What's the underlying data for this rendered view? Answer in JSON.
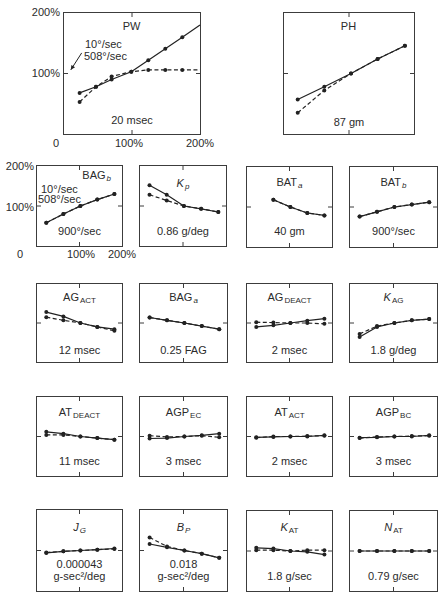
{
  "axes": {
    "top_row": {
      "y_ticks": [
        "200%",
        "100%"
      ],
      "x_ticks": [
        "0",
        "100%",
        "200%"
      ]
    },
    "second_row": {
      "y_ticks": [
        "200%",
        "100%"
      ],
      "x_ticks": [
        "0",
        "100%",
        "200%"
      ]
    }
  },
  "style": {
    "line_color": "#222222",
    "text_color": "#2b2b2b",
    "border_color": "#3c3c3c"
  },
  "chart_data": [
    {
      "id": "PW",
      "type": "line",
      "title": {
        "main": "PW",
        "sub": ""
      },
      "value_label": [
        "20 msec"
      ],
      "xlim": [
        0,
        200
      ],
      "ylim": [
        0,
        200
      ],
      "xlabel": "",
      "ylabel": "",
      "x_tick_labels": [
        "0",
        "100%",
        "200%"
      ],
      "y_tick_labels": [
        "100%",
        "200%"
      ],
      "x": [
        23,
        47,
        70,
        99,
        124,
        149,
        174
      ],
      "series": [
        {
          "name": "10°/sec",
          "style": "solid",
          "values": [
            68,
            78,
            90,
            103,
            122,
            141,
            160
          ],
          "end": [
            200,
            180
          ]
        },
        {
          "name": "508°/sec",
          "style": "dashed",
          "values": [
            53,
            78,
            95,
            103,
            106,
            106,
            106
          ],
          "end": [
            200,
            106
          ]
        }
      ],
      "annotations": [
        {
          "text": "10°/sec"
        },
        {
          "text": "508°/sec"
        },
        {
          "type": "arrow",
          "from": [
            26,
            134
          ],
          "to": [
            10,
            106
          ]
        }
      ]
    },
    {
      "id": "PH",
      "type": "line",
      "title": {
        "main": "PH",
        "sub": ""
      },
      "value_label": [
        "87 gm"
      ],
      "xlim": [
        0,
        200
      ],
      "ylim": [
        0,
        200
      ],
      "x": [
        21,
        62,
        103,
        144,
        186
      ],
      "series": [
        {
          "name": "10°/sec",
          "style": "solid",
          "values": [
            57,
            78,
            100,
            124,
            146
          ]
        },
        {
          "name": "508°/sec",
          "style": "dashed",
          "values": [
            35,
            72,
            100,
            124,
            146
          ]
        }
      ]
    },
    {
      "id": "BAGb",
      "type": "line",
      "title": {
        "main": "BAG",
        "sub": "b"
      },
      "value_label": [
        "900°/sec"
      ],
      "xlim": [
        0,
        200
      ],
      "ylim": [
        0,
        200
      ],
      "x_tick_labels": [
        "0",
        "100%",
        "200%"
      ],
      "y_tick_labels": [
        "100%",
        "200%"
      ],
      "x": [
        22,
        62,
        102,
        142,
        182
      ],
      "series": [
        {
          "name": "10°/sec",
          "style": "solid",
          "values": [
            58,
            80,
            100,
            116,
            130
          ]
        },
        {
          "name": "508°/sec",
          "style": "dashed",
          "values": [
            58,
            80,
            100,
            116,
            130
          ]
        }
      ],
      "annotations": [
        {
          "text": "10°/sec"
        },
        {
          "text": "508°/sec"
        }
      ]
    },
    {
      "id": "Kp",
      "type": "line",
      "title": {
        "main": "K",
        "sub": "p"
      },
      "value_label": [
        "0.86 g/deg"
      ],
      "xlim": [
        0,
        200
      ],
      "ylim": [
        0,
        200
      ],
      "x": [
        22,
        62,
        102,
        142,
        182
      ],
      "series": [
        {
          "name": "10°/sec",
          "style": "solid",
          "values": [
            152,
            128,
            100,
            93,
            85
          ]
        },
        {
          "name": "508°/sec",
          "style": "dashed",
          "values": [
            128,
            114,
            100,
            93,
            85
          ]
        }
      ]
    },
    {
      "id": "BATa",
      "type": "line",
      "title": {
        "main": "BAT",
        "sub": "a"
      },
      "value_label": [
        "40 gm"
      ],
      "xlim": [
        0,
        200
      ],
      "ylim": [
        0,
        200
      ],
      "x": [
        22,
        62,
        102,
        142,
        182
      ],
      "series": [
        {
          "name": "10°/sec",
          "style": "solid",
          "values": [
            null,
            118,
            100,
            85,
            79
          ]
        },
        {
          "name": "508°/sec",
          "style": "dashed",
          "values": [
            null,
            118,
            100,
            85,
            79
          ]
        }
      ]
    },
    {
      "id": "BATb",
      "type": "line",
      "title": {
        "main": "BAT",
        "sub": "b"
      },
      "value_label": [
        "900°/sec"
      ],
      "xlim": [
        0,
        200
      ],
      "ylim": [
        0,
        200
      ],
      "x": [
        22,
        62,
        102,
        142,
        182
      ],
      "series": [
        {
          "name": "10°/sec",
          "style": "solid",
          "values": [
            76,
            88,
            100,
            106,
            112
          ]
        },
        {
          "name": "508°/sec",
          "style": "dashed",
          "values": [
            76,
            88,
            100,
            106,
            112
          ]
        }
      ]
    },
    {
      "id": "AG_ACT",
      "type": "line",
      "title": {
        "main": "AG",
        "sub": "ACT"
      },
      "value_label": [
        "12 msec"
      ],
      "xlim": [
        0,
        200
      ],
      "ylim": [
        0,
        200
      ],
      "x": [
        22,
        62,
        102,
        142,
        182
      ],
      "series": [
        {
          "name": "10°/sec",
          "style": "solid",
          "values": [
            128,
            117,
            100,
            90,
            84
          ]
        },
        {
          "name": "508°/sec",
          "style": "dashed",
          "values": [
            115,
            107,
            100,
            90,
            80
          ]
        }
      ]
    },
    {
      "id": "BAGa",
      "type": "line",
      "title": {
        "main": "BAG",
        "sub": "a"
      },
      "value_label": [
        "0.25 FAG"
      ],
      "xlim": [
        0,
        200
      ],
      "ylim": [
        0,
        200
      ],
      "x": [
        22,
        62,
        102,
        142,
        182
      ],
      "series": [
        {
          "name": "10°/sec",
          "style": "solid",
          "values": [
            114,
            107,
            100,
            92,
            84
          ]
        },
        {
          "name": "508°/sec",
          "style": "dashed",
          "values": [
            114,
            107,
            100,
            92,
            84
          ]
        }
      ]
    },
    {
      "id": "AG_DEACT",
      "type": "line",
      "title": {
        "main": "AG",
        "sub": "DEACT"
      },
      "value_label": [
        "2 msec"
      ],
      "xlim": [
        0,
        200
      ],
      "ylim": [
        0,
        200
      ],
      "x": [
        22,
        62,
        102,
        142,
        182
      ],
      "series": [
        {
          "name": "10°/sec",
          "style": "solid",
          "values": [
            90,
            94,
            100,
            106,
            111
          ]
        },
        {
          "name": "508°/sec",
          "style": "dashed",
          "values": [
            102,
            101,
            100,
            100,
            98
          ]
        }
      ]
    },
    {
      "id": "K_AG",
      "type": "line",
      "title": {
        "main": "K",
        "sub": "AG"
      },
      "value_label": [
        "1.8 g/deg"
      ],
      "xlim": [
        0,
        200
      ],
      "ylim": [
        0,
        200
      ],
      "x": [
        22,
        62,
        102,
        142,
        182
      ],
      "series": [
        {
          "name": "10°/sec",
          "style": "solid",
          "values": [
            64,
            90,
            100,
            107,
            110
          ]
        },
        {
          "name": "508°/sec",
          "style": "dashed",
          "values": [
            72,
            92,
            100,
            107,
            110
          ]
        }
      ]
    },
    {
      "id": "AT_DEACT",
      "type": "line",
      "title": {
        "main": "AT",
        "sub": "DEACT"
      },
      "value_label": [
        "11 msec"
      ],
      "xlim": [
        0,
        200
      ],
      "ylim": [
        0,
        200
      ],
      "x": [
        22,
        62,
        102,
        142,
        182
      ],
      "series": [
        {
          "name": "10°/sec",
          "style": "solid",
          "values": [
            112,
            107,
            100,
            96,
            92
          ]
        },
        {
          "name": "508°/sec",
          "style": "dashed",
          "values": [
            104,
            104,
            100,
            96,
            92
          ]
        }
      ]
    },
    {
      "id": "AGP_EC",
      "type": "line",
      "title": {
        "main": "AGP",
        "sub": "EC"
      },
      "value_label": [
        "3 msec"
      ],
      "xlim": [
        0,
        200
      ],
      "ylim": [
        0,
        200
      ],
      "x": [
        22,
        62,
        102,
        142,
        182
      ],
      "series": [
        {
          "name": "10°/sec",
          "style": "solid",
          "values": [
            95,
            96,
            100,
            103,
            107
          ]
        },
        {
          "name": "508°/sec",
          "style": "dashed",
          "values": [
            102,
            99,
            100,
            102,
            98
          ]
        }
      ]
    },
    {
      "id": "AT_ACT",
      "type": "line",
      "title": {
        "main": "AT",
        "sub": "ACT"
      },
      "value_label": [
        "2 msec"
      ],
      "xlim": [
        0,
        200
      ],
      "ylim": [
        0,
        200
      ],
      "x": [
        22,
        62,
        102,
        142,
        182
      ],
      "series": [
        {
          "name": "10°/sec",
          "style": "solid",
          "values": [
            98,
            99,
            100,
            100,
            103
          ]
        },
        {
          "name": "508°/sec",
          "style": "dashed",
          "values": [
            97,
            100,
            100,
            101,
            102
          ]
        }
      ]
    },
    {
      "id": "AGP_BC",
      "type": "line",
      "title": {
        "main": "AGP",
        "sub": "BC"
      },
      "value_label": [
        "3 msec"
      ],
      "xlim": [
        0,
        200
      ],
      "ylim": [
        0,
        200
      ],
      "x": [
        22,
        62,
        102,
        142,
        182
      ],
      "series": [
        {
          "name": "10°/sec",
          "style": "solid",
          "values": [
            97,
            98,
            100,
            100,
            103
          ]
        },
        {
          "name": "508°/sec",
          "style": "dashed",
          "values": [
            96,
            99,
            100,
            101,
            102
          ]
        }
      ]
    },
    {
      "id": "J_G",
      "type": "line",
      "title": {
        "main": "J",
        "sub": "G"
      },
      "value_label": [
        "0.000043",
        "g-sec²/deg"
      ],
      "xlim": [
        0,
        200
      ],
      "ylim": [
        0,
        200
      ],
      "x": [
        22,
        62,
        102,
        142,
        182
      ],
      "series": [
        {
          "name": "10°/sec",
          "style": "solid",
          "values": [
            94,
            98,
            100,
            102,
            105
          ]
        },
        {
          "name": "508°/sec",
          "style": "dashed",
          "values": [
            95,
            98,
            100,
            102,
            104
          ]
        }
      ]
    },
    {
      "id": "B_P",
      "type": "line",
      "title": {
        "main": "B",
        "sub": "P"
      },
      "value_label": [
        "0.018",
        "g-sec²/deg"
      ],
      "xlim": [
        0,
        200
      ],
      "ylim": [
        0,
        200
      ],
      "x": [
        22,
        62,
        102,
        142,
        182
      ],
      "series": [
        {
          "name": "10°/sec",
          "style": "solid",
          "values": [
            116,
            108,
            100,
            92,
            82
          ]
        },
        {
          "name": "508°/sec",
          "style": "dashed",
          "values": [
            132,
            110,
            100,
            92,
            82
          ]
        }
      ]
    },
    {
      "id": "K_AT",
      "type": "line",
      "title": {
        "main": "K",
        "sub": "AT"
      },
      "value_label": [
        "1.8 g/sec"
      ],
      "xlim": [
        0,
        200
      ],
      "ylim": [
        0,
        200
      ],
      "x": [
        22,
        62,
        102,
        142,
        182
      ],
      "series": [
        {
          "name": "10°/sec",
          "style": "solid",
          "values": [
            108,
            106,
            100,
            98,
            91
          ]
        },
        {
          "name": "508°/sec",
          "style": "dashed",
          "values": [
            102,
            102,
            100,
            102,
            102
          ]
        }
      ]
    },
    {
      "id": "N_AT",
      "type": "line",
      "title": {
        "main": "N",
        "sub": "AT"
      },
      "value_label": [
        "0.79 g/sec"
      ],
      "xlim": [
        0,
        200
      ],
      "ylim": [
        0,
        200
      ],
      "x": [
        22,
        62,
        102,
        142,
        182
      ],
      "series": [
        {
          "name": "10°/sec",
          "style": "solid",
          "values": [
            100,
            100,
            100,
            100,
            100
          ]
        },
        {
          "name": "508°/sec",
          "style": "dashed",
          "values": [
            100,
            100,
            100,
            100,
            100
          ]
        }
      ]
    }
  ]
}
